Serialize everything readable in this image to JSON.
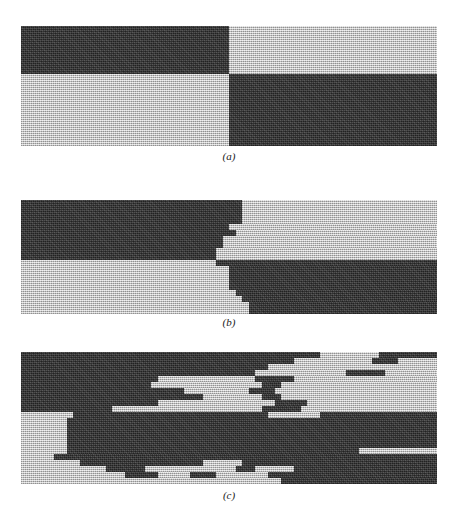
{
  "figure": {
    "title": "",
    "background_color": "#ffffff",
    "dark_color": "#3d3d3d",
    "light_color": "#c6c6c6",
    "panel_left_px": 21,
    "panel_width_px": 416,
    "row_height_px": 6,
    "columns": 64
  },
  "panels": [
    {
      "id": "panel-a",
      "caption": "(a)",
      "top_px": 26,
      "caption_top_px": 153,
      "rows": 20,
      "description": "clean quadrant checkerboard, no jitter",
      "row_segments": [
        [
          [
            "d",
            32
          ],
          [
            "l",
            32
          ]
        ],
        [
          [
            "d",
            32
          ],
          [
            "l",
            32
          ]
        ],
        [
          [
            "d",
            32
          ],
          [
            "l",
            32
          ]
        ],
        [
          [
            "d",
            32
          ],
          [
            "l",
            32
          ]
        ],
        [
          [
            "d",
            32
          ],
          [
            "l",
            32
          ]
        ],
        [
          [
            "d",
            32
          ],
          [
            "l",
            32
          ]
        ],
        [
          [
            "d",
            32
          ],
          [
            "l",
            32
          ]
        ],
        [
          [
            "d",
            32
          ],
          [
            "l",
            32
          ]
        ],
        [
          [
            "l",
            32
          ],
          [
            "d",
            32
          ]
        ],
        [
          [
            "l",
            32
          ],
          [
            "d",
            32
          ]
        ],
        [
          [
            "l",
            32
          ],
          [
            "d",
            32
          ]
        ],
        [
          [
            "l",
            32
          ],
          [
            "d",
            32
          ]
        ],
        [
          [
            "l",
            32
          ],
          [
            "d",
            32
          ]
        ],
        [
          [
            "l",
            32
          ],
          [
            "d",
            32
          ]
        ],
        [
          [
            "l",
            32
          ],
          [
            "d",
            32
          ]
        ],
        [
          [
            "l",
            32
          ],
          [
            "d",
            32
          ]
        ],
        [
          [
            "l",
            32
          ],
          [
            "d",
            32
          ]
        ],
        [
          [
            "l",
            32
          ],
          [
            "d",
            32
          ]
        ],
        [
          [
            "l",
            32
          ],
          [
            "d",
            32
          ]
        ],
        [
          [
            "l",
            32
          ],
          [
            "d",
            32
          ]
        ]
      ]
    },
    {
      "id": "panel-b",
      "caption": "(b)",
      "top_px": 200,
      "caption_top_px": 319,
      "rows": 19,
      "description": "quadrant checkerboard with small row-wise boundary jitter",
      "row_segments": [
        [
          [
            "d",
            34
          ],
          [
            "l",
            30
          ]
        ],
        [
          [
            "d",
            34
          ],
          [
            "l",
            30
          ]
        ],
        [
          [
            "d",
            34
          ],
          [
            "l",
            30
          ]
        ],
        [
          [
            "d",
            34
          ],
          [
            "l",
            30
          ]
        ],
        [
          [
            "d",
            32
          ],
          [
            "l",
            32
          ]
        ],
        [
          [
            "d",
            33
          ],
          [
            "l",
            31
          ]
        ],
        [
          [
            "d",
            31
          ],
          [
            "l",
            33
          ]
        ],
        [
          [
            "d",
            31
          ],
          [
            "l",
            33
          ]
        ],
        [
          [
            "d",
            30
          ],
          [
            "l",
            34
          ]
        ],
        [
          [
            "d",
            30
          ],
          [
            "l",
            34
          ]
        ],
        [
          [
            "l",
            30
          ],
          [
            "d",
            34
          ]
        ],
        [
          [
            "l",
            32
          ],
          [
            "d",
            32
          ]
        ],
        [
          [
            "l",
            32
          ],
          [
            "d",
            32
          ]
        ],
        [
          [
            "l",
            32
          ],
          [
            "d",
            32
          ]
        ],
        [
          [
            "l",
            32
          ],
          [
            "d",
            32
          ]
        ],
        [
          [
            "l",
            33
          ],
          [
            "d",
            31
          ]
        ],
        [
          [
            "l",
            34
          ],
          [
            "d",
            30
          ]
        ],
        [
          [
            "l",
            35
          ],
          [
            "d",
            29
          ]
        ],
        [
          [
            "l",
            35
          ],
          [
            "d",
            29
          ]
        ]
      ]
    },
    {
      "id": "panel-c",
      "caption": "(c)",
      "top_px": 352,
      "caption_top_px": 492,
      "rows": 22,
      "description": "heavily randomized / interleaved row segments, blurred boundary",
      "row_segments": [
        [
          [
            "d",
            46
          ],
          [
            "l",
            9
          ],
          [
            "d",
            9
          ]
        ],
        [
          [
            "d",
            42
          ],
          [
            "l",
            12
          ],
          [
            "d",
            4
          ],
          [
            "l",
            6
          ]
        ],
        [
          [
            "d",
            38
          ],
          [
            "l",
            26
          ]
        ],
        [
          [
            "d",
            36
          ],
          [
            "l",
            14
          ],
          [
            "d",
            6
          ],
          [
            "l",
            8
          ]
        ],
        [
          [
            "d",
            21
          ],
          [
            "l",
            15
          ],
          [
            "d",
            6
          ],
          [
            "l",
            22
          ]
        ],
        [
          [
            "d",
            20
          ],
          [
            "l",
            17
          ],
          [
            "d",
            3
          ],
          [
            "l",
            24
          ]
        ],
        [
          [
            "d",
            25
          ],
          [
            "l",
            10
          ],
          [
            "d",
            4
          ],
          [
            "l",
            25
          ]
        ],
        [
          [
            "d",
            28
          ],
          [
            "l",
            9
          ],
          [
            "d",
            3
          ],
          [
            "l",
            24
          ]
        ],
        [
          [
            "d",
            21
          ],
          [
            "l",
            18
          ],
          [
            "d",
            5
          ],
          [
            "l",
            20
          ]
        ],
        [
          [
            "d",
            14
          ],
          [
            "l",
            23
          ],
          [
            "d",
            6
          ],
          [
            "l",
            21
          ]
        ],
        [
          [
            "l",
            8
          ],
          [
            "d",
            30
          ],
          [
            "l",
            8
          ],
          [
            "d",
            18
          ]
        ],
        [
          [
            "l",
            7
          ],
          [
            "d",
            57
          ]
        ],
        [
          [
            "l",
            7
          ],
          [
            "d",
            57
          ]
        ],
        [
          [
            "l",
            7
          ],
          [
            "d",
            57
          ]
        ],
        [
          [
            "l",
            7
          ],
          [
            "d",
            57
          ]
        ],
        [
          [
            "l",
            7
          ],
          [
            "d",
            57
          ]
        ],
        [
          [
            "l",
            7
          ],
          [
            "d",
            45
          ],
          [
            "l",
            12
          ]
        ],
        [
          [
            "l",
            5
          ],
          [
            "d",
            59
          ]
        ],
        [
          [
            "l",
            9
          ],
          [
            "d",
            19
          ],
          [
            "l",
            6
          ],
          [
            "d",
            30
          ]
        ],
        [
          [
            "l",
            13
          ],
          [
            "d",
            6
          ],
          [
            "l",
            14
          ],
          [
            "d",
            3
          ],
          [
            "l",
            6
          ],
          [
            "d",
            22
          ]
        ],
        [
          [
            "l",
            16
          ],
          [
            "d",
            5
          ],
          [
            "l",
            5
          ],
          [
            "d",
            4
          ],
          [
            "l",
            8
          ],
          [
            "d",
            26
          ]
        ],
        [
          [
            "l",
            40
          ],
          [
            "d",
            24
          ]
        ]
      ]
    }
  ]
}
